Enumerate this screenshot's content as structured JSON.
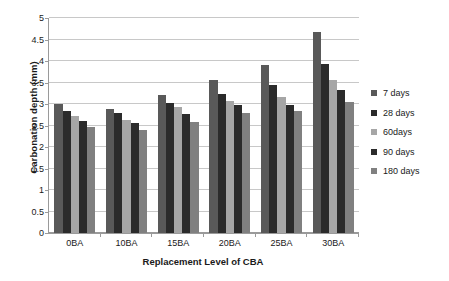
{
  "chart_data": {
    "type": "bar",
    "title": "",
    "xlabel": "Replacement Level of CBA",
    "ylabel": "Carbonation depth  (mm)",
    "categories": [
      "0BA",
      "10BA",
      "15BA",
      "20BA",
      "25BA",
      "30BA"
    ],
    "series": [
      {
        "name": "7 days",
        "color": "#595959",
        "values": [
          3.0,
          2.89,
          3.2,
          3.55,
          3.9,
          4.68
        ]
      },
      {
        "name": "28 days",
        "color": "#2b2b2b",
        "values": [
          2.83,
          2.78,
          3.02,
          3.23,
          3.44,
          3.93
        ]
      },
      {
        "name": "60days",
        "color": "#a6a6a6",
        "values": [
          2.73,
          2.62,
          2.93,
          3.06,
          3.16,
          3.56
        ]
      },
      {
        "name": "90 days",
        "color": "#2b2b2b",
        "values": [
          2.61,
          2.55,
          2.76,
          2.98,
          2.97,
          3.33
        ]
      },
      {
        "name": "180 days",
        "color": "#808080",
        "values": [
          2.46,
          2.39,
          2.58,
          2.79,
          2.83,
          3.04
        ]
      }
    ],
    "ylim": [
      0,
      5
    ],
    "yticks": [
      "0",
      "0.5",
      "1",
      "1.5",
      "2",
      "2.5",
      "3",
      "3.5",
      "4",
      "4.5",
      "5"
    ],
    "ytick_values": [
      0,
      0.5,
      1,
      1.5,
      2,
      2.5,
      3,
      3.5,
      4,
      4.5,
      5
    ],
    "grid": true,
    "legend_position": "right"
  }
}
